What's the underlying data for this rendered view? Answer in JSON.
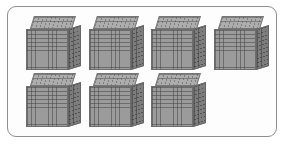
{
  "figure": {
    "name": "base-ten-blocks-thousand-cubes",
    "type": "base-ten-block-model",
    "represented_value": "7000",
    "block_type": "thousand-cube",
    "block_count": 7,
    "rows": [
      {
        "row_index": 1,
        "count": 4
      },
      {
        "row_index": 2,
        "count": 3
      }
    ],
    "cube_grid_divisions": "10 x 10",
    "panel_shape": "rounded-rectangle"
  },
  "colors": {
    "page_background": "#ffffff",
    "panel_background": "#fdfdfd",
    "panel_border": "#8e8e93",
    "cube_front": "#9b9b9b",
    "cube_top": "#adadad",
    "cube_right": "#7d7d7d",
    "cube_outline": "#6e6e6e"
  },
  "blocks": [
    {
      "id": "cube-1",
      "row": 1,
      "column": 1,
      "left": 18,
      "top": 9,
      "label": "thousand-cube"
    },
    {
      "id": "cube-2",
      "row": 1,
      "column": 2,
      "left": 81,
      "top": 9,
      "label": "thousand-cube"
    },
    {
      "id": "cube-3",
      "row": 1,
      "column": 3,
      "left": 143,
      "top": 9,
      "label": "thousand-cube"
    },
    {
      "id": "cube-4",
      "row": 1,
      "column": 4,
      "left": 206,
      "top": 9,
      "label": "thousand-cube"
    },
    {
      "id": "cube-5",
      "row": 2,
      "column": 1,
      "left": 18,
      "top": 66,
      "label": "thousand-cube"
    },
    {
      "id": "cube-6",
      "row": 2,
      "column": 2,
      "left": 81,
      "top": 66,
      "label": "thousand-cube"
    },
    {
      "id": "cube-7",
      "row": 2,
      "column": 3,
      "left": 143,
      "top": 66,
      "label": "thousand-cube"
    }
  ]
}
